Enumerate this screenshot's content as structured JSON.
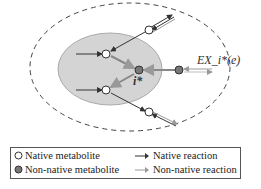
{
  "diagram": {
    "labels": {
      "exchange": "EX_i*(e)",
      "target": "i*"
    },
    "colors": {
      "ellipse_fill": "#d3d3d3",
      "ellipse_stroke": "#999999",
      "dashed_boundary": "#444444",
      "native_arrow": "#333333",
      "nonnative_arrow": "#999999",
      "native_node_fill": "#ffffff",
      "nonnative_node_fill": "#777777"
    }
  },
  "legend": {
    "items": [
      {
        "symbol": "open-circle",
        "label": "Native metabolite"
      },
      {
        "symbol": "solid-arrow",
        "label": "Native reaction"
      },
      {
        "symbol": "filled-circle",
        "label": "Non-native metabolite"
      },
      {
        "symbol": "gray-arrow",
        "label": "Non-native reaction"
      }
    ]
  }
}
